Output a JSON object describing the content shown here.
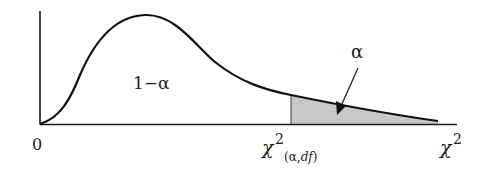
{
  "diagram": {
    "type": "chi-square distribution density curve",
    "origin_label": "0",
    "area_left_label": "1−α",
    "area_right_label": "α",
    "critical_value_label": {
      "base": "χ",
      "superscript": "2",
      "subscript_open": "(",
      "subscript_alpha": "α",
      "subscript_sep": ",",
      "subscript_df": "df",
      "subscript_close": ")"
    },
    "x_axis_label": {
      "base": "χ",
      "superscript": "2"
    },
    "colors": {
      "line": "#1a1a1a",
      "shade": "#c8c8c8",
      "background": "#ffffff"
    }
  }
}
